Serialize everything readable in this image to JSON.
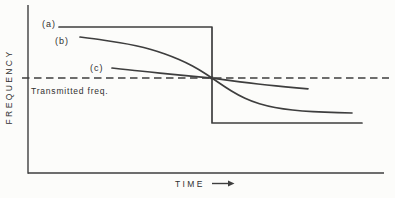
{
  "figure": {
    "y_axis_label": "FREQUENCY",
    "x_axis_label": "TIME",
    "reference_label": "Transmitted freq.",
    "curve_labels": {
      "a": "(a)",
      "b": "(b)",
      "c": "(c)"
    },
    "colors": {
      "background": "#fcfcfa",
      "ink": "#3e3e3e",
      "text": "#303030"
    }
  },
  "chart_data": {
    "type": "line",
    "title": "",
    "xlabel": "TIME",
    "ylabel": "FREQUENCY",
    "grid": false,
    "numeric_ticks": false,
    "axes_units": "qualitative (no numeric scale shown)",
    "legend_position": "inline-labels",
    "reference_line": {
      "label": "Transmitted freq.",
      "orientation": "horizontal",
      "style": "dashed",
      "y_px": 78,
      "x1_px": 22,
      "x2_px": 389
    },
    "crossover_point_px": [
      212,
      78
    ],
    "series": [
      {
        "name": "(a)",
        "shape": "step",
        "description": "constant high frequency, abrupt vertical drop, constant low frequency",
        "points_px": [
          [
            59,
            27
          ],
          [
            212,
            27
          ],
          [
            212,
            123
          ],
          [
            362,
            123
          ]
        ]
      },
      {
        "name": "(b)",
        "shape": "smooth",
        "description": "gradual S-shaped frequency transition through the transmitted frequency",
        "points_px": [
          [
            80,
            37
          ],
          [
            96,
            39
          ],
          [
            112,
            41.5
          ],
          [
            128,
            44
          ],
          [
            144,
            47.5
          ],
          [
            158,
            51.5
          ],
          [
            172,
            56.5
          ],
          [
            186,
            62.5
          ],
          [
            199,
            69.5
          ],
          [
            212,
            78
          ],
          [
            225,
            87
          ],
          [
            238,
            95
          ],
          [
            252,
            101.5
          ],
          [
            267,
            106
          ],
          [
            283,
            109
          ],
          [
            302,
            111
          ],
          [
            324,
            112.3
          ],
          [
            352,
            113
          ]
        ]
      },
      {
        "name": "(c)",
        "shape": "smooth",
        "description": "shallow frequency transition through the transmitted frequency",
        "points_px": [
          [
            112,
            68
          ],
          [
            130,
            70
          ],
          [
            150,
            72
          ],
          [
            170,
            74.2
          ],
          [
            191,
            76.2
          ],
          [
            212,
            78
          ],
          [
            231,
            80.8
          ],
          [
            249,
            83
          ],
          [
            267,
            85
          ],
          [
            285,
            86.8
          ],
          [
            308,
            88.8
          ]
        ]
      }
    ]
  },
  "geometry": {
    "y_axis": {
      "x": 28,
      "y1": 5,
      "y2": 173.7
    },
    "x_axis": {
      "y": 173,
      "x1": 28,
      "x2": 384
    }
  }
}
